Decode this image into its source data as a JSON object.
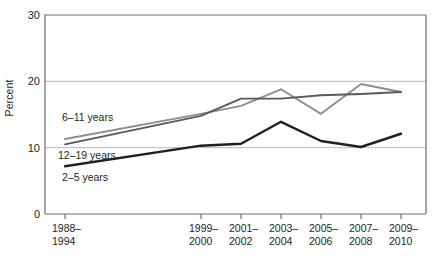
{
  "chart_data": {
    "type": "line",
    "title": "",
    "xlabel": "",
    "ylabel": "Percent",
    "ylim": [
      0,
      30
    ],
    "yticks": [
      0,
      10,
      20,
      30
    ],
    "grid": "horizontal",
    "legend_position": "inline-left",
    "categories": [
      "1988–\n1994",
      "1999–\n2000",
      "2001–\n2002",
      "2003–\n2004",
      "2005–\n2006",
      "2007–\n2008",
      "2009–\n2010"
    ],
    "category_lines": [
      [
        "1988–",
        "1994"
      ],
      [
        "1999–",
        "2000"
      ],
      [
        "2001–",
        "2002"
      ],
      [
        "2003–",
        "2004"
      ],
      [
        "2005–",
        "2006"
      ],
      [
        "2007–",
        "2008"
      ],
      [
        "2009–",
        "2010"
      ]
    ],
    "series": [
      {
        "name": "6–11 years",
        "color": "#8e8e8e",
        "values": [
          11.3,
          15.1,
          16.3,
          18.8,
          15.1,
          19.6,
          18.4
        ]
      },
      {
        "name": "12–19 years",
        "color": "#58595b",
        "values": [
          10.5,
          14.8,
          17.4,
          17.4,
          17.9,
          18.1,
          18.4
        ]
      },
      {
        "name": "2–5 years",
        "color": "#231f20",
        "values": [
          7.2,
          10.3,
          10.6,
          13.9,
          11.0,
          10.1,
          12.1
        ]
      }
    ]
  },
  "axis": {
    "y_title": "Percent",
    "y_tick_labels": [
      "30",
      "20",
      "10",
      "0"
    ]
  },
  "series_labels": [
    {
      "text": "6–11 years"
    },
    {
      "text": "12–19 years"
    },
    {
      "text": "2–5 years"
    }
  ]
}
